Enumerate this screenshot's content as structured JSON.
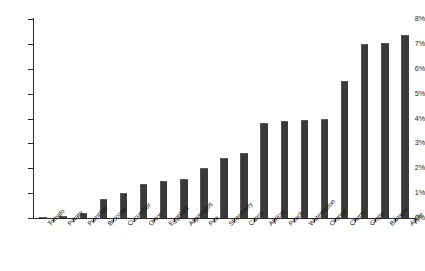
{
  "chart_data": {
    "type": "bar",
    "title": "",
    "xlabel": "",
    "ylabel": "",
    "ylim": [
      0,
      8
    ],
    "grid": false,
    "legend": "none",
    "y_tick_labels": [
      "0%",
      "1%",
      "2%",
      "3%",
      "4%",
      "5%",
      "6%",
      "7%",
      "8%"
    ],
    "y_tick_values": [
      0,
      1,
      2,
      3,
      4,
      5,
      6,
      7,
      8
    ],
    "bar_color": "#3a3a3a",
    "axis_color": "#2b2b2b",
    "categories": [
      "Tomato",
      "Potato",
      "Pumpkin",
      "Broccoli",
      "Cucumber",
      "Onion",
      "Eggplant",
      "Asparagus",
      "Pea",
      "Strawberry",
      "Carrot",
      "Apricot",
      "Peach",
      "Watermelon",
      "Orange",
      "Cherry",
      "Grape",
      "Banana",
      "Apple"
    ],
    "values": [
      0.05,
      0.1,
      0.2,
      0.75,
      1.0,
      1.35,
      1.5,
      1.55,
      2.0,
      2.4,
      2.6,
      3.8,
      3.9,
      3.95,
      4.0,
      5.5,
      7.0,
      7.05,
      7.35
    ]
  }
}
